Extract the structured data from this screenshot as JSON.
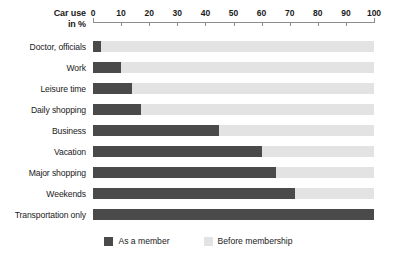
{
  "chart_data": {
    "type": "bar",
    "orientation": "horizontal",
    "title": "",
    "xlabel": "Car use in %",
    "ylabel": "",
    "xlim": [
      0,
      100
    ],
    "grid": false,
    "legend_position": "bottom-center",
    "axis_title": {
      "line1": "Car use",
      "line2": "in %"
    },
    "tick_labels": [
      "0",
      "10",
      "20",
      "30",
      "40",
      "50",
      "60",
      "70",
      "80",
      "90",
      "100"
    ],
    "tick_values": [
      0,
      10,
      20,
      30,
      40,
      50,
      60,
      70,
      80,
      90,
      100
    ],
    "categories": [
      "Doctor, officials",
      "Work",
      "Leisure time",
      "Daily shopping",
      "Business",
      "Vacation",
      "Major shopping",
      "Weekends",
      "Transportation only"
    ],
    "series": [
      {
        "name": "As a member",
        "color": "#4a4a4a",
        "values": [
          3,
          10,
          14,
          17,
          45,
          60,
          65,
          72,
          100
        ]
      },
      {
        "name": "Before membership",
        "color": "#e3e3e3",
        "values": [
          100,
          100,
          100,
          100,
          100,
          100,
          100,
          100,
          100
        ]
      }
    ],
    "legend": [
      {
        "label": "As a member",
        "color": "#4a4a4a",
        "swatch": "dark"
      },
      {
        "label": "Before membership",
        "color": "#e3e3e3",
        "swatch": "light"
      }
    ]
  }
}
